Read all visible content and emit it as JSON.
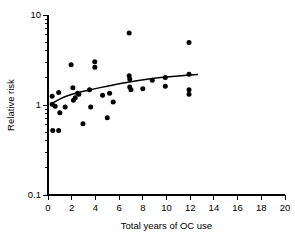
{
  "chart_data": {
    "type": "scatter",
    "title": "",
    "subtitle": "",
    "xlabel": "Total years of OC use",
    "ylabel": "Relative risk",
    "xlim": [
      0,
      20
    ],
    "ylim": [
      0.1,
      10
    ],
    "yscale": "log",
    "xscale": "linear",
    "grid": false,
    "legend": null,
    "xticks": [
      0,
      2,
      4,
      6,
      8,
      10,
      12,
      14,
      16,
      18,
      20
    ],
    "xtick_labels": [
      "0",
      "2",
      "4",
      "6",
      "8",
      "10",
      "12",
      "14",
      "16",
      "18",
      "20"
    ],
    "yticks": [
      0.1,
      1,
      10
    ],
    "ytick_labels": [
      "0.1",
      "1",
      "10"
    ],
    "yminor_ticks": [
      0.2,
      0.3,
      0.4,
      0.5,
      0.6,
      0.7,
      0.8,
      0.9,
      2,
      3,
      4,
      5,
      6,
      7,
      8,
      9
    ],
    "series": [
      {
        "name": "Study estimates",
        "marker": "filled-circle",
        "color": "#000000",
        "points": [
          {
            "x": 0.35,
            "y": 1.25
          },
          {
            "x": 0.35,
            "y": 1.02
          },
          {
            "x": 0.4,
            "y": 0.52
          },
          {
            "x": 0.6,
            "y": 0.97
          },
          {
            "x": 0.9,
            "y": 1.38
          },
          {
            "x": 0.9,
            "y": 0.52
          },
          {
            "x": 1.0,
            "y": 0.82
          },
          {
            "x": 1.45,
            "y": 0.95
          },
          {
            "x": 1.95,
            "y": 2.8
          },
          {
            "x": 2.1,
            "y": 1.55
          },
          {
            "x": 2.15,
            "y": 1.13
          },
          {
            "x": 2.3,
            "y": 1.2
          },
          {
            "x": 2.5,
            "y": 1.35
          },
          {
            "x": 2.6,
            "y": 1.32
          },
          {
            "x": 2.95,
            "y": 0.62
          },
          {
            "x": 3.5,
            "y": 1.48
          },
          {
            "x": 3.6,
            "y": 0.95
          },
          {
            "x": 3.95,
            "y": 3.02
          },
          {
            "x": 3.95,
            "y": 2.62
          },
          {
            "x": 4.6,
            "y": 1.28
          },
          {
            "x": 5.0,
            "y": 0.72
          },
          {
            "x": 5.2,
            "y": 1.35
          },
          {
            "x": 5.5,
            "y": 1.08
          },
          {
            "x": 6.85,
            "y": 6.3
          },
          {
            "x": 6.85,
            "y": 2.12
          },
          {
            "x": 6.9,
            "y": 1.95
          },
          {
            "x": 6.9,
            "y": 1.58
          },
          {
            "x": 7.0,
            "y": 1.48
          },
          {
            "x": 8.0,
            "y": 1.52
          },
          {
            "x": 8.8,
            "y": 1.88
          },
          {
            "x": 9.9,
            "y": 2.02
          },
          {
            "x": 9.9,
            "y": 1.62
          },
          {
            "x": 11.9,
            "y": 4.95
          },
          {
            "x": 11.9,
            "y": 2.2
          },
          {
            "x": 11.9,
            "y": 1.48
          },
          {
            "x": 11.9,
            "y": 1.32
          }
        ]
      }
    ],
    "fit_curve": {
      "name": "Fitted trend",
      "style": "solid",
      "color": "#000000",
      "points": [
        {
          "x": 0.25,
          "y": 1.02
        },
        {
          "x": 0.75,
          "y": 1.12
        },
        {
          "x": 1.3,
          "y": 1.22
        },
        {
          "x": 2.0,
          "y": 1.32
        },
        {
          "x": 3.0,
          "y": 1.42
        },
        {
          "x": 4.0,
          "y": 1.52
        },
        {
          "x": 5.0,
          "y": 1.62
        },
        {
          "x": 6.0,
          "y": 1.72
        },
        {
          "x": 7.0,
          "y": 1.82
        },
        {
          "x": 8.0,
          "y": 1.9
        },
        {
          "x": 9.0,
          "y": 1.98
        },
        {
          "x": 10.0,
          "y": 2.05
        },
        {
          "x": 11.0,
          "y": 2.1
        },
        {
          "x": 12.0,
          "y": 2.15
        },
        {
          "x": 12.6,
          "y": 2.18
        }
      ]
    }
  }
}
